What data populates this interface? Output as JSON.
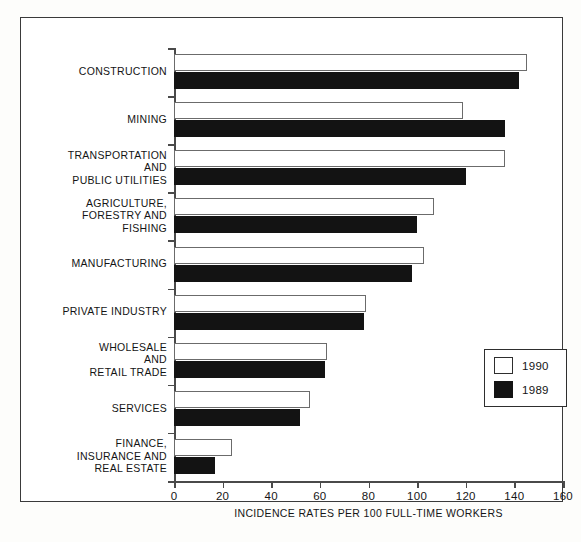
{
  "chart_data": {
    "type": "bar",
    "title": "",
    "orientation": "horizontal",
    "xlabel": "INCIDENCE RATES PER 100 FULL-TIME WORKERS",
    "ylabel": "",
    "xlim": [
      0,
      160
    ],
    "xticks": [
      "0",
      "20",
      "40",
      "60",
      "80",
      "100",
      "120",
      "140",
      "160"
    ],
    "grid": false,
    "legend_position": "right-middle",
    "categories": [
      "CONSTRUCTION",
      "MINING",
      "TRANSPORTATION AND PUBLIC UTILITIES",
      "AGRICULTURE, FORESTRY AND FISHING",
      "MANUFACTURING",
      "PRIVATE INDUSTRY",
      "WHOLESALE AND RETAIL TRADE",
      "SERVICES",
      "FINANCE, INSURANCE AND REAL ESTATE"
    ],
    "category_lines": [
      [
        "CONSTRUCTION"
      ],
      [
        "MINING"
      ],
      [
        "TRANSPORTATION",
        "AND",
        "PUBLIC UTILITIES"
      ],
      [
        "AGRICULTURE,",
        "FORESTRY AND",
        "FISHING"
      ],
      [
        "MANUFACTURING"
      ],
      [
        "PRIVATE INDUSTRY"
      ],
      [
        "WHOLESALE",
        "AND",
        "RETAIL TRADE"
      ],
      [
        "SERVICES"
      ],
      [
        "FINANCE,",
        "INSURANCE AND",
        "REAL ESTATE"
      ]
    ],
    "series": [
      {
        "name": "1990",
        "color": "#ffffff",
        "values": [
          145,
          119,
          136,
          107,
          103,
          79,
          63,
          56,
          24
        ]
      },
      {
        "name": "1989",
        "color": "#131313",
        "values": [
          142,
          136,
          120,
          100,
          98,
          78,
          62,
          52,
          17
        ]
      }
    ]
  },
  "legend": {
    "items": [
      {
        "label": "1990",
        "swatch": "white-square"
      },
      {
        "label": "1989",
        "swatch": "black-square"
      }
    ]
  }
}
